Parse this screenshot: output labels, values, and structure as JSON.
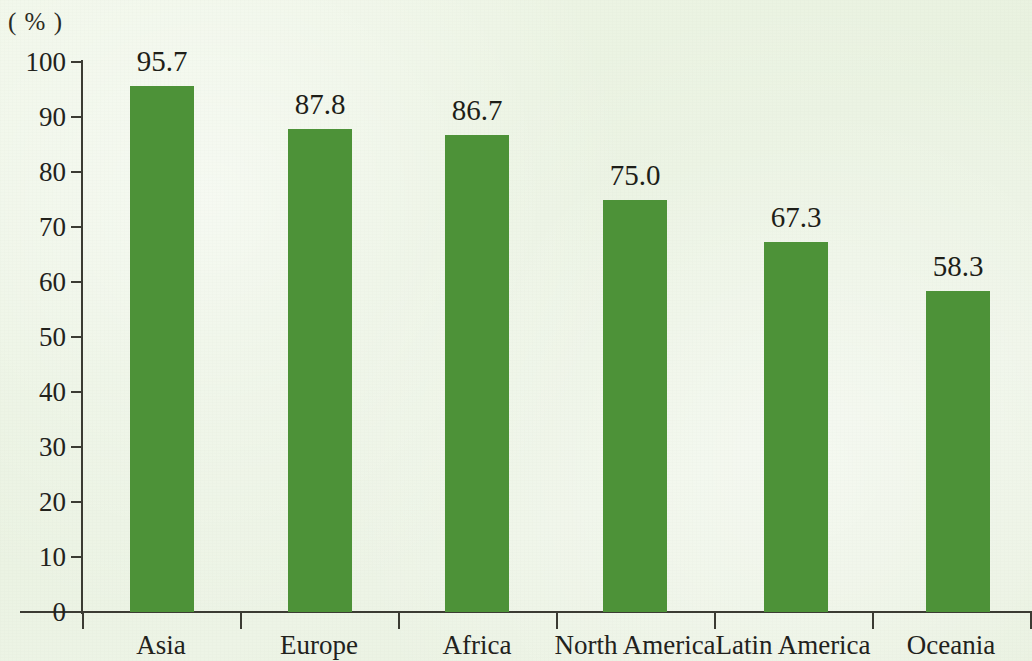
{
  "chart_data": {
    "type": "bar",
    "title": "",
    "subtitle": "",
    "xlabel": "",
    "ylabel": "",
    "unit_label": "( % )",
    "categories": [
      "Asia",
      "Europe",
      "Africa",
      "North America",
      "Latin America",
      "Oceania"
    ],
    "values": [
      95.7,
      87.8,
      86.7,
      75.0,
      67.3,
      58.3
    ],
    "value_labels": [
      "95.7",
      "87.8",
      "86.7",
      "75.0",
      "67.3",
      "58.3"
    ],
    "ylim": [
      0,
      100
    ],
    "ytick_values": [
      0,
      10,
      20,
      30,
      40,
      50,
      60,
      70,
      80,
      90,
      100
    ],
    "ytick_labels": [
      "0",
      "10",
      "20",
      "30",
      "40",
      "50",
      "60",
      "70",
      "80",
      "90",
      "100"
    ],
    "grid": false,
    "legend": null,
    "legend_position": "none",
    "series": [
      {
        "name": "",
        "values": [
          95.7,
          87.8,
          86.7,
          75.0,
          67.3,
          58.3
        ]
      }
    ],
    "colors": {
      "bar": "#4d9238",
      "background": "#eef5e6",
      "axis": "#3b3b33",
      "text": "#22221c"
    }
  }
}
